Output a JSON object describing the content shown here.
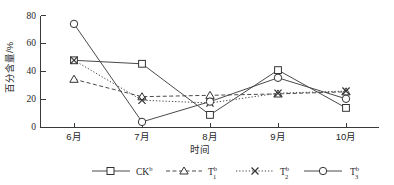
{
  "chart_data": {
    "type": "line",
    "title": "",
    "xlabel": "时间",
    "ylabel": "百分含量/%",
    "categories": [
      "6月",
      "7月",
      "8月",
      "9月",
      "10月"
    ],
    "ylim": [
      0,
      80
    ],
    "yticks": [
      0,
      20,
      40,
      60,
      80
    ],
    "grid": false,
    "legend_position": "bottom",
    "series": [
      {
        "name": "CK",
        "label": "CK",
        "superscript": "b",
        "subscript": "",
        "marker": "square",
        "linestyle": "solid",
        "values": [
          48,
          45.5,
          9,
          41,
          14
        ]
      },
      {
        "name": "T1",
        "label": "T",
        "superscript": "b",
        "subscript": "1",
        "marker": "triangle",
        "linestyle": "dashed",
        "values": [
          34.5,
          22,
          23,
          24,
          25.5
        ]
      },
      {
        "name": "T2",
        "label": "T",
        "superscript": "b",
        "subscript": "2",
        "marker": "x",
        "linestyle": "dotted",
        "values": [
          48,
          19.5,
          17.5,
          24.5,
          26
        ]
      },
      {
        "name": "T3",
        "label": "T",
        "superscript": "b",
        "subscript": "3",
        "marker": "circle",
        "linestyle": "solid",
        "values": [
          74,
          4,
          18.5,
          35.5,
          20.5
        ]
      }
    ]
  },
  "axis": {
    "ytick_labels": [
      "0",
      "20",
      "40",
      "60",
      "80"
    ],
    "xtick_labels": [
      "6月",
      "7月",
      "8月",
      "9月",
      "10月"
    ],
    "y_title": "百分含量/%",
    "x_title": "时间"
  },
  "legend": {
    "items": [
      {
        "text": "CK",
        "sup": "b",
        "sub": ""
      },
      {
        "text": "T",
        "sup": "b",
        "sub": "1"
      },
      {
        "text": "T",
        "sup": "b",
        "sub": "2"
      },
      {
        "text": "T",
        "sup": "b",
        "sub": "3"
      }
    ]
  },
  "colors": {
    "line": "#4a4a4a",
    "axis": "#3a3a3a",
    "marker_fill": "#ffffff",
    "marker_stroke": "#333333",
    "text": "#262626",
    "background": "#ffffff"
  }
}
